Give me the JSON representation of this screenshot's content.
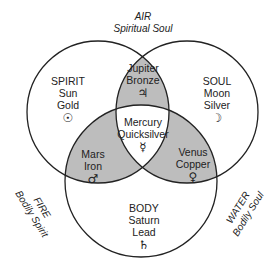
{
  "diagram": {
    "type": "venn-3",
    "colors": {
      "shade": "#bdbdbd",
      "stroke": "#222222",
      "background": "#ffffff"
    },
    "outer_labels": {
      "air": {
        "title": "AIR",
        "subtitle": "Spiritual Soul"
      },
      "fire": {
        "title": "FIRE",
        "subtitle": "Bodily Spirit"
      },
      "water": {
        "title": "WATER",
        "subtitle": "Bodily Soul"
      }
    },
    "regions": {
      "spirit": {
        "lines": [
          "SPIRIT",
          "Sun",
          "Gold"
        ],
        "symbol": "☉",
        "symbol_name": "sun-symbol"
      },
      "soul": {
        "lines": [
          "SOUL",
          "Moon",
          "Silver"
        ],
        "symbol": "☽",
        "symbol_name": "moon-symbol"
      },
      "body": {
        "lines": [
          "BODY",
          "Saturn",
          "Lead"
        ],
        "symbol": "♄",
        "symbol_name": "saturn-symbol"
      },
      "jupiter": {
        "lines": [
          "Jupiter",
          "Bronze"
        ],
        "symbol": "♃",
        "symbol_name": "jupiter-symbol"
      },
      "mars": {
        "lines": [
          "Mars",
          "Iron"
        ],
        "symbol": "♂",
        "symbol_name": "mars-symbol"
      },
      "venus": {
        "lines": [
          "Venus",
          "Copper"
        ],
        "symbol": "♀",
        "symbol_name": "venus-symbol"
      },
      "mercury": {
        "lines": [
          "Mercury",
          "Quicksilver"
        ],
        "symbol": "☿",
        "symbol_name": "mercury-symbol"
      }
    }
  }
}
